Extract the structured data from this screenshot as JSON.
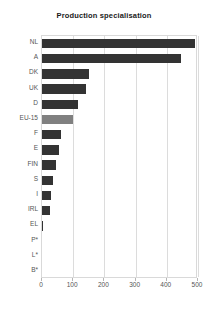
{
  "chart_data": {
    "type": "bar",
    "orientation": "horizontal",
    "title": "Production specialisation",
    "xlabel": "",
    "ylabel": "",
    "categories": [
      "NL",
      "A",
      "DK",
      "UK",
      "D",
      "EU-15",
      "F",
      "E",
      "FIN",
      "S",
      "I",
      "IRL",
      "EL",
      "P*",
      "L*",
      "B*"
    ],
    "values": [
      490,
      445,
      150,
      140,
      115,
      100,
      62,
      55,
      45,
      35,
      30,
      27,
      3,
      0,
      0,
      0
    ],
    "highlight_category": "EU-15",
    "xlim": [
      0,
      500
    ],
    "xticks": [
      0,
      100,
      200,
      300,
      400,
      500
    ],
    "xtick_labels": [
      "0",
      "100",
      "200",
      "300",
      "400",
      "500"
    ],
    "grid": "vertical",
    "legend": null,
    "bar_color": "#333333",
    "highlight_color": "#808080",
    "gridline_color": "#dcdcdc",
    "axis_border_color": "#d9d9d9",
    "label_color": "#555555",
    "title_color": "#1a1a1a",
    "background": "#ffffff"
  }
}
